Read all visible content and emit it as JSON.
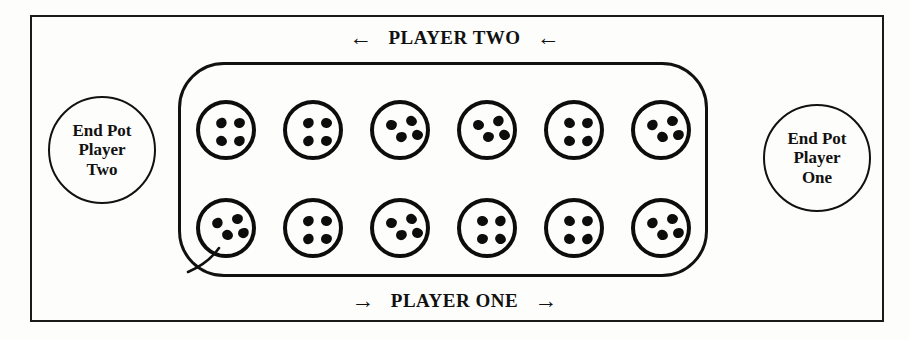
{
  "board": {
    "title": "Mancala board layout",
    "frame_color": "#1a1a1a",
    "line_color": "#111111",
    "seed_color": "#0d0d0d",
    "background": "#fdfdfc"
  },
  "labels": {
    "top": {
      "text": "PLAYER TWO",
      "left_arrow": "←",
      "right_arrow": "←",
      "direction": "leftward"
    },
    "bottom": {
      "text": "PLAYER ONE",
      "left_arrow": "→",
      "right_arrow": "→",
      "direction": "rightward"
    }
  },
  "end_pots": [
    {
      "id": "end-pot-player-two",
      "line1": "End Pot",
      "line2": "Player",
      "line3": "Two",
      "seeds": 0,
      "side": "left"
    },
    {
      "id": "end-pot-player-one",
      "line1": "End Pot",
      "line2": "Player",
      "line3": "One",
      "seeds": 0,
      "side": "right"
    }
  ],
  "rows": [
    {
      "owner": "PLAYER TWO",
      "position": "top",
      "pits": [
        {
          "index": 1,
          "seeds": 4,
          "arrangement": "grid"
        },
        {
          "index": 2,
          "seeds": 4,
          "arrangement": "grid"
        },
        {
          "index": 3,
          "seeds": 4,
          "arrangement": "scatter"
        },
        {
          "index": 4,
          "seeds": 4,
          "arrangement": "scatter"
        },
        {
          "index": 5,
          "seeds": 4,
          "arrangement": "grid"
        },
        {
          "index": 6,
          "seeds": 4,
          "arrangement": "scatter"
        }
      ]
    },
    {
      "owner": "PLAYER ONE",
      "position": "bottom",
      "pits": [
        {
          "index": 1,
          "seeds": 4,
          "arrangement": "scatter"
        },
        {
          "index": 2,
          "seeds": 4,
          "arrangement": "grid"
        },
        {
          "index": 3,
          "seeds": 4,
          "arrangement": "scatter"
        },
        {
          "index": 4,
          "seeds": 4,
          "arrangement": "grid"
        },
        {
          "index": 5,
          "seeds": 4,
          "arrangement": "grid"
        },
        {
          "index": 6,
          "seeds": 4,
          "arrangement": "scatter"
        }
      ]
    }
  ],
  "geometry": {
    "pit_diameter": 60,
    "pit_spacing": 87,
    "first_pit_left": 196,
    "top_row_top": 100,
    "bottom_row_top": 198,
    "seed_layouts": {
      "grid": [
        [
          16,
          14
        ],
        [
          34,
          14
        ],
        [
          16,
          32
        ],
        [
          34,
          32
        ]
      ],
      "scatter": [
        [
          12,
          16
        ],
        [
          32,
          12
        ],
        [
          22,
          28
        ],
        [
          38,
          26
        ]
      ]
    }
  }
}
